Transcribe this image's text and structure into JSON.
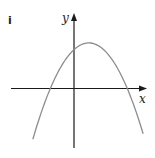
{
  "figure": {
    "panel_label": "i",
    "x_axis_label": "x",
    "y_axis_label": "y",
    "curve_description": "downward-opening parabola",
    "curve_color": "#8c8c8c",
    "axis_color": "#1a1a1a"
  },
  "chart_data": {
    "type": "line",
    "title": "",
    "xlabel": "x",
    "ylabel": "y",
    "xlim": [
      -4.2,
      4.8
    ],
    "ylim": [
      -3.6,
      4.7
    ],
    "roots": [
      -1.6,
      3.6
    ],
    "vertex": [
      1.0,
      3.0
    ],
    "y_intercept": 2.56,
    "series": [
      {
        "name": "parabola",
        "equation_form": "y = a(x - 1)^2 + 3, a < 0"
      }
    ],
    "grid": false,
    "legend": "none"
  }
}
